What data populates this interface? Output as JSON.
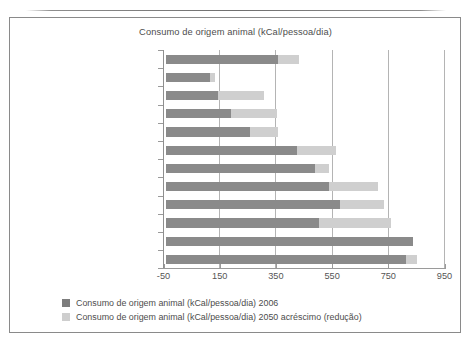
{
  "figure": {
    "title": "Consumo de origem animal (kCal/pessoa/dia)"
  },
  "legend": {
    "items": [
      {
        "swatch": "legend-swatch-2006",
        "color": "#7d7d7d",
        "label": "Consumo de origem animal (kCal/pessoa/dia) 2006"
      },
      {
        "swatch": "legend-swatch-2050",
        "color": "#cecece",
        "label": "Consumo de origem animal (kCal/pessoa/dia) 2050 acréscimo (redução)"
      }
    ]
  },
  "axis": {
    "x_ticks": [
      "-50",
      "150",
      "350",
      "550",
      "750",
      "950"
    ],
    "x_tick_values": [
      -50,
      150,
      350,
      550,
      750,
      950
    ]
  },
  "chart_data": {
    "type": "bar",
    "orientation": "horizontal",
    "stacked": true,
    "title": "Consumo de origem animal (kCal/pessoa/dia)",
    "xlabel": "",
    "ylabel": "",
    "xlim": [
      -50,
      960
    ],
    "xticks": [
      -50,
      150,
      350,
      550,
      750,
      950
    ],
    "grid": "vertical",
    "legend_position": "bottom-left",
    "categories": [
      "MUNDO",
      "África subsaariana",
      "Índia",
      "Ásia (menos China e Índia)",
      "Oriente Médio e Norte da África",
      "América Latina (menos Brasil)",
      "Outros OCDE",
      "Antiga União Soviética",
      "Brasil",
      "China",
      "Canadá e EUA",
      "União Europeia"
    ],
    "series": [
      {
        "name": "Consumo de origem animal (kCal/pessoa/dia) 2006",
        "color": "#8a8a8a",
        "values": [
          400,
          155,
          185,
          230,
          300,
          465,
          530,
          580,
          620,
          545,
          880,
          855
        ]
      },
      {
        "name": "Consumo de origem animal (kCal/pessoa/dia) 2050 acréscimo (redução)",
        "color": "#cfcfcf",
        "values": [
          75,
          20,
          165,
          165,
          100,
          140,
          50,
          175,
          155,
          255,
          0,
          40
        ]
      }
    ],
    "totals_2050": [
      475,
      175,
      350,
      395,
      400,
      605,
      580,
      755,
      775,
      800,
      880,
      895
    ]
  },
  "colors": {
    "series_2006": "#8a8a8a",
    "series_2050": "#cfcfcf",
    "gridline": "#b4b4b4",
    "axis": "#9a9a9a",
    "text": "#4d4d4d",
    "border": "#8a8a8a",
    "background": "#ffffff"
  }
}
